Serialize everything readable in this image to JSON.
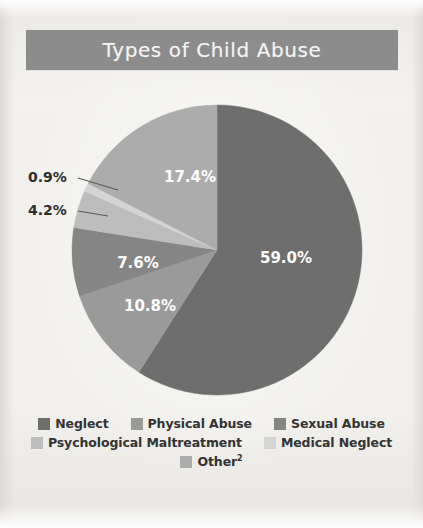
{
  "title": {
    "text": "Types of Child Abuse",
    "banner_color": "#8c8c8c",
    "text_color": "#f4f4f4"
  },
  "background_color": "#efeeea",
  "chart_data": {
    "type": "pie",
    "title": "Types of Child Abuse",
    "categories": [
      "Neglect",
      "Physical Abuse",
      "Sexual Abuse",
      "Psychological Maltreatment",
      "Medical Neglect",
      "Other²"
    ],
    "values": [
      59.0,
      10.8,
      7.6,
      4.2,
      0.9,
      17.4
    ],
    "value_labels": [
      "59.0%",
      "10.8%",
      "7.6%",
      "4.2%",
      "0.9%",
      "17.4%"
    ],
    "colors": [
      "#6e6e6e",
      "#9a9a9a",
      "#858585",
      "#bdbdbd",
      "#d4d4d4",
      "#acacac"
    ],
    "label_placement": [
      "inside",
      "inside",
      "inside",
      "callout",
      "callout",
      "inside"
    ],
    "start_angle_deg": 0,
    "direction": "clockwise",
    "legend_position": "bottom",
    "grid": false,
    "xlabel": "",
    "ylabel": ""
  },
  "slice_labels": {
    "neglect": "59.0%",
    "physical_abuse": "10.8%",
    "sexual_abuse": "7.6%",
    "psychological_maltreatment": "4.2%",
    "medical_neglect": "0.9%",
    "other": "17.4%"
  },
  "legend": {
    "rows": [
      [
        {
          "label": "Neglect",
          "color": "#6e6e6e"
        },
        {
          "label": "Physical Abuse",
          "color": "#9a9a9a"
        },
        {
          "label": "Sexual Abuse",
          "color": "#858585"
        }
      ],
      [
        {
          "label": "Psychological Maltreatment",
          "color": "#bdbdbd"
        },
        {
          "label": "Medical Neglect",
          "color": "#d4d4d4"
        }
      ],
      [
        {
          "label": "Other",
          "sup": "2",
          "color": "#acacac"
        }
      ]
    ]
  }
}
